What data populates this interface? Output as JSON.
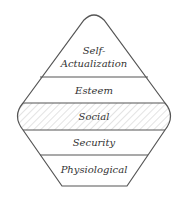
{
  "diagram": {
    "type": "hierarchy-of-needs",
    "levels": [
      {
        "label_line1": "Self-",
        "label_line2": "Actualization"
      },
      {
        "label": "Esteem"
      },
      {
        "label": "Social",
        "highlighted": true
      },
      {
        "label": "Security"
      },
      {
        "label": "Physiological"
      }
    ],
    "colors": {
      "stroke": "#555555",
      "text": "#333333",
      "hatch": "#c8c8c8",
      "background": "#ffffff"
    }
  }
}
